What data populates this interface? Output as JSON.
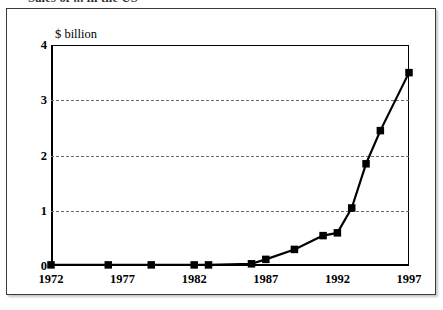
{
  "figure": {
    "title_cut_off": "Sales of ... in the US",
    "unit_label": "$ billion"
  },
  "chart_data": {
    "type": "line",
    "title": "",
    "xlabel": "",
    "ylabel": "$ billion",
    "xlim": [
      1972,
      1997
    ],
    "ylim": [
      0,
      4
    ],
    "grid": "horizontal-dashed",
    "legend": "none",
    "y_ticks": [
      "0",
      "1",
      "2",
      "3",
      "4"
    ],
    "y_tick_values": [
      0,
      1,
      2,
      3,
      4
    ],
    "x_ticks": [
      "1972",
      "1977",
      "1982",
      "1987",
      "1992",
      "1997"
    ],
    "x_tick_values": [
      1972,
      1977,
      1982,
      1987,
      1992,
      1997
    ],
    "marker": "filled-square",
    "line_color": "#000000",
    "x": [
      1972,
      1976,
      1979,
      1982,
      1983,
      1986,
      1987,
      1989,
      1991,
      1992,
      1993,
      1994,
      1995,
      1996,
      1997
    ],
    "values": [
      0.02,
      0.02,
      0.02,
      0.02,
      0.02,
      0.04,
      0.12,
      0.3,
      0.55,
      0.6,
      1.05,
      1.85,
      2.45,
      3.5,
      3.5
    ],
    "series": [
      {
        "name": "sales",
        "points": [
          {
            "x": 1972,
            "y": 0.02
          },
          {
            "x": 1976,
            "y": 0.02
          },
          {
            "x": 1979,
            "y": 0.02
          },
          {
            "x": 1982,
            "y": 0.02
          },
          {
            "x": 1983,
            "y": 0.02
          },
          {
            "x": 1986,
            "y": 0.04
          },
          {
            "x": 1987,
            "y": 0.12
          },
          {
            "x": 1989,
            "y": 0.3
          },
          {
            "x": 1991,
            "y": 0.55
          },
          {
            "x": 1992,
            "y": 0.6
          },
          {
            "x": 1993,
            "y": 1.05
          },
          {
            "x": 1994,
            "y": 1.85
          },
          {
            "x": 1995,
            "y": 2.45
          },
          {
            "x": 1997,
            "y": 3.5
          }
        ]
      }
    ]
  }
}
